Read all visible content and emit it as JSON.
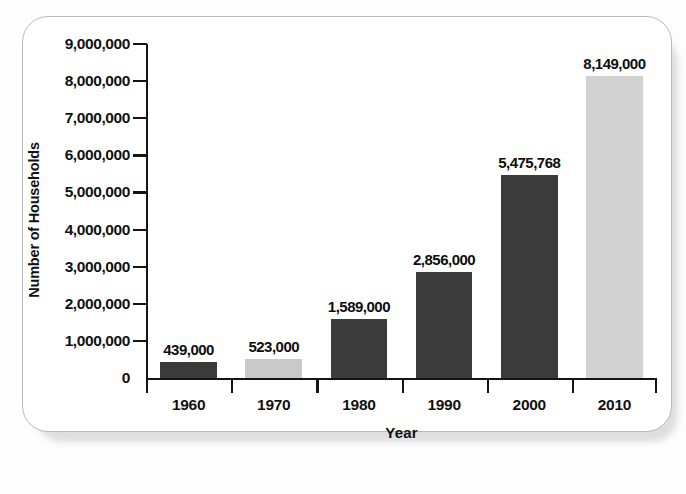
{
  "chart_data": {
    "type": "bar",
    "title": "",
    "xlabel": "Year",
    "ylabel": "Number of Households",
    "categories": [
      "1960",
      "1970",
      "1980",
      "1990",
      "2000",
      "2010"
    ],
    "values": [
      439000,
      523000,
      1589000,
      2856000,
      5475768,
      8149000
    ],
    "value_labels": [
      "439,000",
      "523,000",
      "1,589,000",
      "2,856,000",
      "5,475,768",
      "8,149,000"
    ],
    "bar_colors": [
      "#3b3b3b",
      "#c9c9c9",
      "#3b3b3b",
      "#3b3b3b",
      "#3b3b3b",
      "#d2d2d2"
    ],
    "ylim": [
      0,
      9000000
    ],
    "ytick_values": [
      0,
      1000000,
      2000000,
      3000000,
      4000000,
      5000000,
      6000000,
      7000000,
      8000000,
      9000000
    ],
    "ytick_labels": [
      "0",
      "1,000,000",
      "2,000,000",
      "3,000,000",
      "4,000,000",
      "5,000,000",
      "6,000,000",
      "7,000,000",
      "8,000,000",
      "9,000,000"
    ],
    "grid": false,
    "legend": null,
    "axis_color": "#141414",
    "plot_background": "#ffffff"
  },
  "card": {
    "background": "#ffffff",
    "border_color": "#b9b9b9"
  }
}
